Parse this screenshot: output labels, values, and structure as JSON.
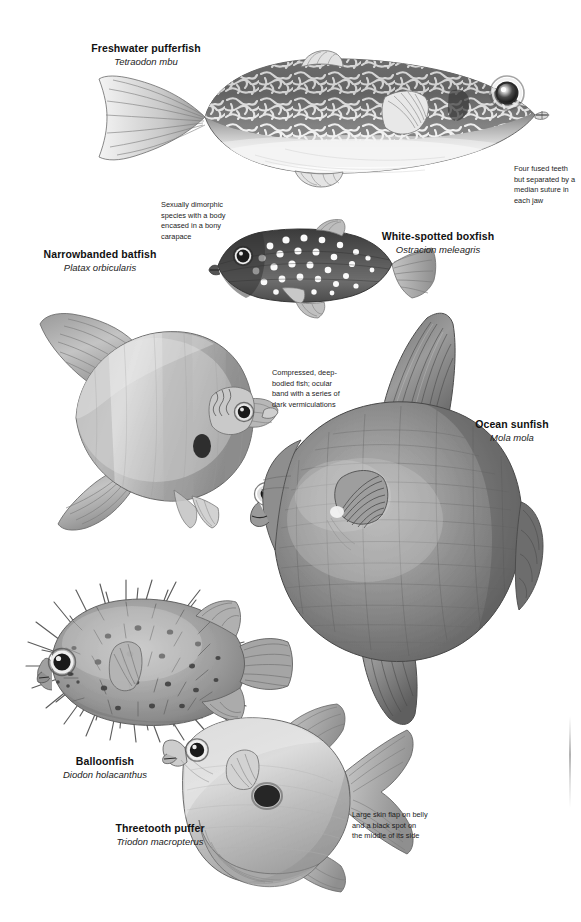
{
  "plate": {
    "title": "Pufferfish and relatives illustration plate",
    "background_color": "#ffffff",
    "ink_color": "#1a1a1a",
    "style": "grayscale pencil illustration"
  },
  "species": [
    {
      "id": "freshwater-pufferfish",
      "common": "Freshwater pufferfish",
      "scientific": "Tetraodon mbu"
    },
    {
      "id": "white-spotted-boxfish",
      "common": "White-spotted boxfish",
      "scientific": "Ostracion meleagris"
    },
    {
      "id": "narrowbanded-batfish",
      "common": "Narrowbanded batfish",
      "scientific": "Platax orbicularis"
    },
    {
      "id": "ocean-sunfish",
      "common": "Ocean sunfish",
      "scientific": "Mola mola"
    },
    {
      "id": "balloonfish",
      "common": "Balloonfish",
      "scientific": "Diodon holacanthus"
    },
    {
      "id": "threetooth-puffer",
      "common": "Threetooth puffer",
      "scientific": "Triodon macropterus"
    }
  ],
  "annotations": [
    {
      "id": "teeth-note",
      "text": "Four fused teeth but separated by a median suture in each jaw"
    },
    {
      "id": "carapace-note",
      "text": "Sexually dimorphic species with a body encased in a bony carapace"
    },
    {
      "id": "vermiculation-note",
      "text": "Compressed, deep-bodied fish; ocular band with a series of dark vermiculations"
    },
    {
      "id": "skinflap-note",
      "text": "Large skin flap on belly and a black spot on the middle of its side"
    }
  ]
}
